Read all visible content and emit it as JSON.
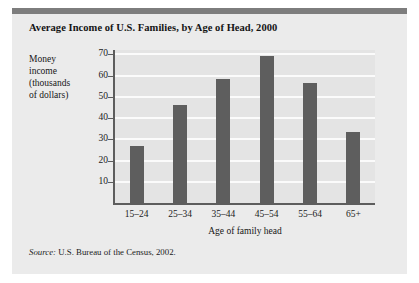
{
  "figure": {
    "title": "Average Income of U.S. Families, by Age of Head, 2000",
    "source_label": "Source:",
    "source_text": " U.S. Bureau of the Census, 2002.",
    "accent_bar_color": "#7d7d7d",
    "panel_background": "#ebebeb",
    "plot_background": "#e4e4e4",
    "bar_color": "#5e5e5e",
    "gridline_color": "#fbfbfb",
    "axis_color": "#5d5d5d"
  },
  "chart_data": {
    "type": "bar",
    "title": "Average Income of U.S. Families, by Age of Head, 2000",
    "xlabel": "Age of family head",
    "ylabel": "Money income (thousands of dollars)",
    "ylabel_lines": [
      "Money",
      "income",
      "(thousands",
      "of dollars)"
    ],
    "categories": [
      "15–24",
      "25–34",
      "35–44",
      "45–54",
      "55–64",
      "65+"
    ],
    "values": [
      27,
      46,
      58.5,
      69,
      56.5,
      33.5
    ],
    "ylim": [
      0,
      72
    ],
    "yticks": [
      70,
      60,
      50,
      40,
      30,
      20,
      10
    ],
    "ytick_labels": [
      "70",
      "60",
      "50",
      "40",
      "30",
      "20",
      "10"
    ],
    "grid": "horizontal",
    "legend": "none",
    "units": "thousands of dollars"
  }
}
